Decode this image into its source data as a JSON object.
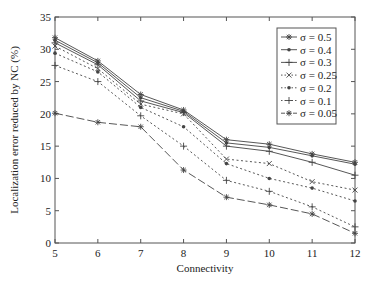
{
  "chart_data": {
    "type": "line",
    "title": "",
    "xlabel": "Connectivity",
    "ylabel": "Localization error reduced by NC (%)",
    "x": [
      5,
      6,
      7,
      8,
      9,
      10,
      11,
      12
    ],
    "xlim": [
      5,
      12
    ],
    "ylim": [
      0,
      35
    ],
    "xticks": [
      "5",
      "6",
      "7",
      "8",
      "9",
      "10",
      "11",
      "12"
    ],
    "yticks": [
      "0",
      "5",
      "10",
      "15",
      "20",
      "25",
      "30",
      "35"
    ],
    "grid": false,
    "legend_position": "upper right",
    "series": [
      {
        "name": "σ = 0.5",
        "style": "solid",
        "marker": "star",
        "values": [
          31.8,
          28.2,
          23.0,
          20.6,
          16.0,
          15.3,
          13.8,
          12.5
        ]
      },
      {
        "name": "σ = 0.4",
        "style": "solid",
        "marker": "dot",
        "values": [
          31.4,
          27.9,
          22.5,
          20.4,
          15.5,
          14.8,
          13.5,
          12.2
        ]
      },
      {
        "name": "σ = 0.3",
        "style": "solid",
        "marker": "plus",
        "values": [
          31.0,
          27.6,
          22.0,
          20.2,
          15.0,
          14.2,
          12.5,
          10.5
        ]
      },
      {
        "name": "σ = 0.25",
        "style": "dotted",
        "marker": "x",
        "values": [
          30.5,
          27.0,
          21.5,
          20.0,
          13.0,
          12.3,
          9.5,
          8.2
        ]
      },
      {
        "name": "σ = 0.2",
        "style": "dotted",
        "marker": "dot",
        "values": [
          29.4,
          26.5,
          21.0,
          18.0,
          12.3,
          10.0,
          8.5,
          6.5
        ]
      },
      {
        "name": "σ = 0.1",
        "style": "dotted",
        "marker": "plus",
        "values": [
          27.5,
          25.0,
          19.7,
          15.0,
          9.7,
          8.0,
          5.6,
          2.5
        ]
      },
      {
        "name": "σ = 0.05",
        "style": "longdash",
        "marker": "star",
        "values": [
          20.1,
          18.7,
          18.0,
          11.3,
          7.1,
          5.9,
          4.5,
          1.5
        ]
      }
    ]
  },
  "colors": {
    "line": "#444444",
    "axis": "#555555",
    "text": "#222222"
  }
}
